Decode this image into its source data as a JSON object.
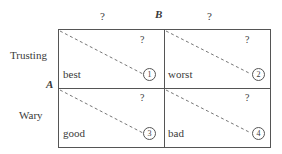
{
  "diagram": {
    "type": "payoff-matrix",
    "row_player": "A",
    "column_player": "B",
    "row_player_label": "A",
    "column_player_label": "B",
    "rows": [
      {
        "label": "Trusting"
      },
      {
        "label": "Wary"
      }
    ],
    "columns": [
      {
        "label": "?"
      },
      {
        "label": "?"
      }
    ],
    "cells": [
      {
        "id": 1,
        "row": "Trusting",
        "column": "left",
        "word": "best",
        "number": "1",
        "question": "?"
      },
      {
        "id": 2,
        "row": "Trusting",
        "column": "right",
        "word": "worst",
        "number": "2",
        "question": "?"
      },
      {
        "id": 3,
        "row": "Wary",
        "column": "left",
        "word": "good",
        "number": "3",
        "question": "?"
      },
      {
        "id": 4,
        "row": "Wary",
        "column": "right",
        "word": "bad",
        "number": "4",
        "question": "?"
      }
    ],
    "arrow_style": "dashed-diagonal",
    "colors": {
      "line": "#555555",
      "text": "#3a3a3a",
      "background": "#ffffff"
    }
  }
}
